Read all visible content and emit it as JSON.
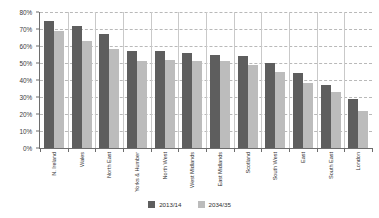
{
  "chart_data": {
    "type": "bar",
    "title": "",
    "subtitle": "",
    "xlabel": "",
    "ylabel": "",
    "ylim": [
      0,
      80
    ],
    "ytick_labels": [
      "80%",
      "70%",
      "60%",
      "50%",
      "40%",
      "30%",
      "20%",
      "10%",
      "0%"
    ],
    "ytick_values": [
      80,
      70,
      60,
      50,
      40,
      30,
      20,
      10,
      0
    ],
    "grid": true,
    "legend_position": "bottom-center",
    "categories": [
      "N. Ireland",
      "Wales",
      "North East",
      "Yorks & Humber",
      "North West",
      "West Midlands",
      "East Midlands",
      "Scotland",
      "South West",
      "East",
      "South East",
      "London"
    ],
    "series": [
      {
        "name": "2013/14",
        "color": "#5e5e5e",
        "values": [
          75,
          72,
          67,
          57,
          57,
          56,
          55,
          54,
          50,
          44,
          37,
          29
        ]
      },
      {
        "name": "2034/35",
        "color": "#bcbcbc",
        "values": [
          69,
          63,
          58,
          51,
          52,
          51,
          51,
          49,
          45,
          38,
          33,
          22
        ]
      }
    ]
  },
  "legend": {
    "items": [
      {
        "label": "2013/14",
        "color": "#5e5e5e"
      },
      {
        "label": "2034/35",
        "color": "#bcbcbc"
      }
    ]
  },
  "colors": {
    "series_2013_14": "#5e5e5e",
    "series_2034_35": "#bcbcbc",
    "axis": "#6d6d6d",
    "gridline": "#b9b9b9",
    "separator": "#c9c9c9",
    "background": "#ffffff",
    "text": "#2f2f2f"
  }
}
